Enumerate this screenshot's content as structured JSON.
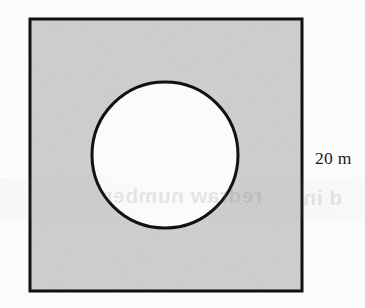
{
  "figure": {
    "type": "geometry-diagram",
    "page_background": "#fbfbfb",
    "square": {
      "name": "shaded-square",
      "fill_color": "#d2d2d2",
      "stroke_color": "#111111",
      "stroke_width": 3,
      "x": 30,
      "y": 19,
      "width": 272,
      "height": 272,
      "side_label": "20 m"
    },
    "circle": {
      "name": "circular-hole",
      "fill_color": "#ffffff",
      "stroke_color": "#111111",
      "stroke_width": 3,
      "center_x": 165,
      "center_y": 155,
      "diameter": 146,
      "radius": 73
    },
    "labels": {
      "side_length": "20 m"
    },
    "artifacts": {
      "show_through_middle": "redraw number",
      "show_through_right": "d in"
    }
  }
}
